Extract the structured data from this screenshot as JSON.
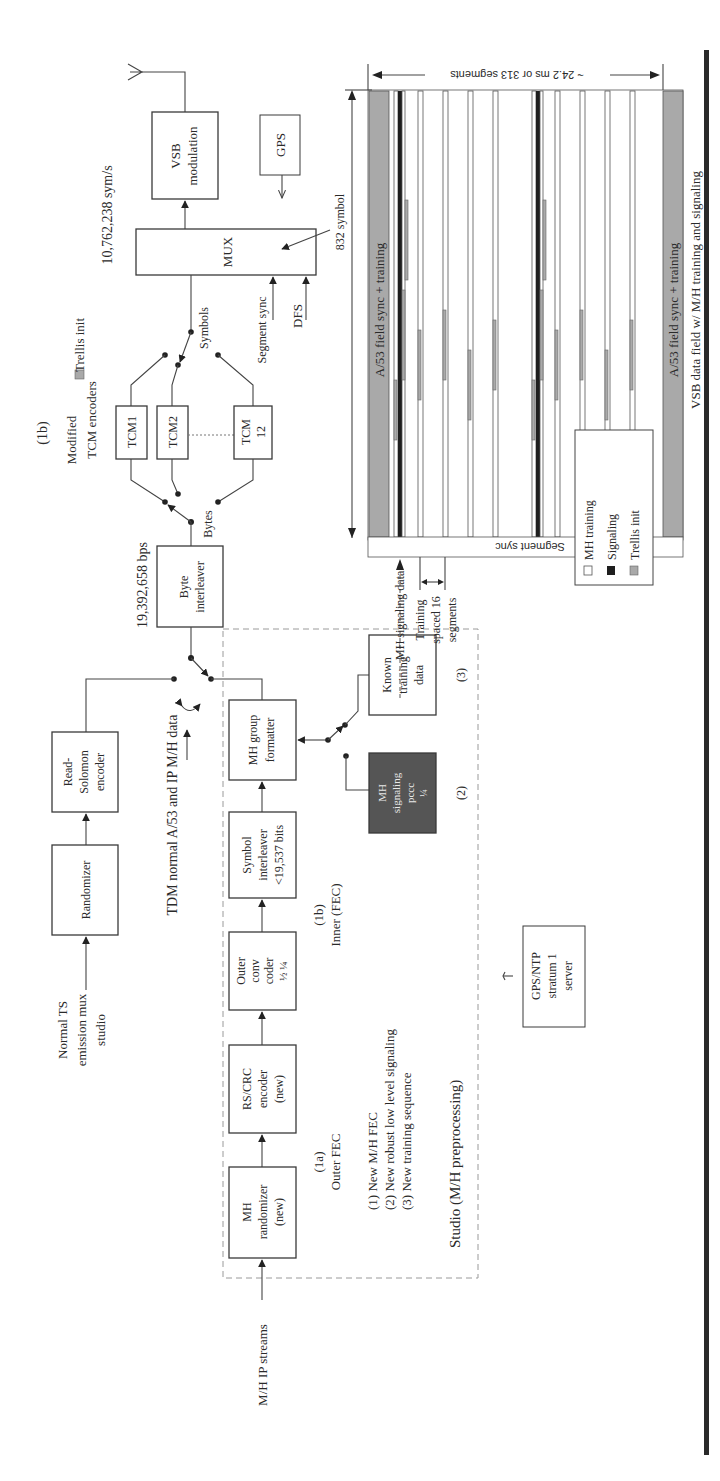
{
  "figure": {
    "orientation": "rotated-90-ccw",
    "antenna": "antenna-icon",
    "blocks": {
      "vsb_modulation": [
        "VSB",
        "modulation"
      ],
      "gps": "GPS",
      "mux": "MUX",
      "tcm1": "TCM1",
      "tcm2": "TCM2",
      "tcm12": [
        "TCM",
        "12"
      ],
      "byte_interleaver": [
        "Byte",
        "interleaver"
      ],
      "randomizer": "Randomizer",
      "read_solomon": [
        "Read-",
        "Solomon",
        "encoder"
      ],
      "mh_group_formatter": [
        "MH group",
        "formatter"
      ],
      "symbol_interleaver": [
        "Symbol",
        "interleaver",
        "<19,537 bits"
      ],
      "outer_conv_coder": [
        "Outer",
        "conv",
        "coder",
        "½ ¼"
      ],
      "rs_crc_encoder": [
        "RS/CRC",
        "encoder",
        "(new)"
      ],
      "mh_randomizer": [
        "MH",
        "randomizer",
        "(new)"
      ],
      "mh_signaling": [
        "MH",
        "signaling",
        "pccc",
        "¼"
      ],
      "known_training": [
        "Known",
        "training",
        "data"
      ],
      "gps_ntp": [
        "GPS/NTP",
        "stratum 1",
        "server"
      ]
    },
    "labels": {
      "sym_rate": "10,762,238 sym/s",
      "bit_rate": "19,392,658 bps",
      "section_1b_top": "(1b)",
      "modified_tcm": [
        "Modified",
        "TCM encoders"
      ],
      "trellis_init_top": "Trellis init",
      "symbols": "Symbols",
      "bytes": "Bytes",
      "segment_sync_in": "Segment sync",
      "dfs": "DFS",
      "symbol_832": "832 symbol",
      "normal_ts": [
        "Normal TS",
        "emission mux",
        "studio"
      ],
      "tdm": "TDM normal A/53 and IP M/H data",
      "inner_fec": [
        "(1b)",
        "Inner (FEC)"
      ],
      "outer_fec": [
        "(1a)",
        "Outer FEC"
      ],
      "notes": [
        "(1) New M/H FEC",
        "(2) New robust low level signaling",
        "(3) New training sequence"
      ],
      "studio": "Studio (M/H preprocessing)",
      "mh_ip_streams": "M/H IP streams",
      "num2": "(2)",
      "num3": "(3)"
    },
    "vsb_field": {
      "duration": "~ 24.2 ms or 313 segments",
      "field_sync_left": "A/53 field sync + training",
      "field_sync_right": "A/53 field sync + training",
      "segment_sync": "Segment sync",
      "mh_signaling_data": "MH signaling data",
      "training_spacing": [
        "Training",
        "spaced 16",
        "segments"
      ],
      "caption": "VSB data field w/ M/H training and signaling"
    },
    "legend": {
      "items": [
        {
          "label": "MH training",
          "swatch": "#ffffff"
        },
        {
          "label": "Signaling",
          "swatch": "#1e1e1e"
        },
        {
          "label": "Trellis init",
          "swatch": "#a9a9a9"
        }
      ]
    },
    "colors": {
      "box_stroke": "#3a3a3a",
      "signaling_box": "#555555",
      "trellis_gray": "#a9a9a9",
      "border_bar": "#2a2a2a"
    }
  }
}
